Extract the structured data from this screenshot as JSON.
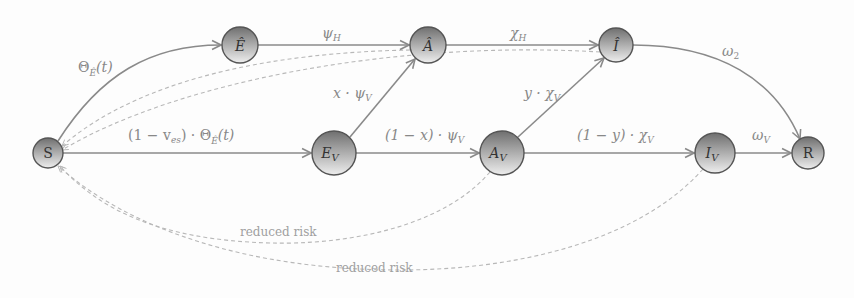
{
  "diagram": {
    "type": "compartmental-flow",
    "nodes": {
      "S": {
        "label": "S",
        "x": 48,
        "y": 153,
        "r": 15
      },
      "E_hat": {
        "label": "Ê",
        "x": 240,
        "y": 45,
        "r": 18
      },
      "A_hat": {
        "label": "Â",
        "x": 428,
        "y": 45,
        "r": 18
      },
      "I_hat": {
        "label": "Î",
        "x": 616,
        "y": 45,
        "r": 17
      },
      "E_V": {
        "label": "E",
        "sub": "V",
        "x": 334,
        "y": 153,
        "r": 22
      },
      "A_V": {
        "label": "A",
        "sub": "V",
        "x": 502,
        "y": 153,
        "r": 22
      },
      "I_V": {
        "label": "I",
        "sub": "V",
        "x": 715,
        "y": 153,
        "r": 20
      },
      "R": {
        "label": "R",
        "x": 808,
        "y": 153,
        "r": 16
      }
    },
    "edges": {
      "s_to_ehat": "Θ_Ê(t)",
      "ehat_to_ahat": "ψ_H",
      "ahat_to_ihat": "χ_H",
      "ihat_to_r": "ω_2",
      "s_to_ev": "(1 − v_es) · Θ_Ê(t)",
      "ev_to_av": "(1 − x) · ψ_V",
      "av_to_iv": "(1 − y) · χ_V",
      "iv_to_r": "ω_V",
      "ev_to_ahat": "x · ψ_V",
      "av_to_ihat": "y · χ_V"
    },
    "edge_labels": {
      "s_ehat_main": "Θ",
      "s_ehat_sub": "Ê",
      "s_ehat_tail": "(t)",
      "ehat_ahat_main": "ψ",
      "ehat_ahat_sub": "H",
      "ahat_ihat_main": "χ",
      "ahat_ihat_sub": "H",
      "ihat_r_main": "ω",
      "ihat_r_sub": "2",
      "s_ev_pre": "(1 − v",
      "s_ev_sub1": "es",
      "s_ev_mid": ") · Θ",
      "s_ev_sub2": "Ê",
      "s_ev_tail": "(t)",
      "ev_av_pre": "(1 − x) · ψ",
      "ev_av_sub": "V",
      "av_iv_pre": "(1 − y) · χ",
      "av_iv_sub": "V",
      "iv_r_main": "ω",
      "iv_r_sub": "V",
      "ev_ahat_pre": "x · ψ",
      "ev_ahat_sub": "V",
      "av_ihat_pre": "y · χ",
      "av_ihat_sub": "V"
    },
    "feedback": {
      "upper_dashed_from": [
        "Â",
        "Î"
      ],
      "lower_dashed_from": [
        "A_V",
        "I_V"
      ],
      "label_1": "reduced risk",
      "label_2": "reduced risk"
    },
    "colors": {
      "node_fill_light": "#e8e8e8",
      "node_fill_dark": "#7a7a7a",
      "node_stroke": "#555555",
      "edge": "#8a8a8a",
      "dashed": "#b8b8b8",
      "label": "#888888"
    }
  }
}
